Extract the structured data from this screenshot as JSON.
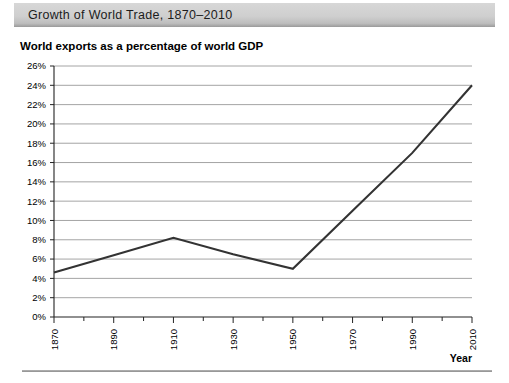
{
  "title": "Growth of World Trade, 1870–2010",
  "subtitle": "World exports as a percentage of world GDP",
  "axis_title_x": "Year",
  "chart_data": {
    "type": "line",
    "title": "Growth of World Trade, 1870–2010",
    "subtitle": "World exports as a percentage of world GDP",
    "xlabel": "Year",
    "ylabel": "",
    "categories": [
      "1870",
      "1890",
      "1910",
      "1930",
      "1950",
      "1970",
      "1990",
      "2010"
    ],
    "x": [
      1870,
      1890,
      1910,
      1930,
      1950,
      1970,
      1990,
      2010
    ],
    "values": [
      4.6,
      6.4,
      8.2,
      6.5,
      5.0,
      11.0,
      17.0,
      24.0
    ],
    "ylim": [
      0,
      26
    ],
    "xlim": [
      1870,
      2010
    ],
    "ytick_labels": [
      "0%",
      "2%",
      "4%",
      "6%",
      "8%",
      "10%",
      "12%",
      "14%",
      "16%",
      "18%",
      "20%",
      "22%",
      "24%",
      "26%"
    ],
    "ytick_values": [
      0,
      2,
      4,
      6,
      8,
      10,
      12,
      14,
      16,
      18,
      20,
      22,
      24,
      26
    ],
    "xtick_labels": [
      "1870",
      "1890",
      "1910",
      "1930",
      "1950",
      "1970",
      "1990",
      "2010"
    ],
    "grid": "horizontal",
    "legend": "none",
    "series": [
      {
        "name": "World exports as a percentage of world GDP",
        "values": [
          4.6,
          6.4,
          8.2,
          6.5,
          5.0,
          11.0,
          17.0,
          24.0
        ]
      }
    ]
  }
}
